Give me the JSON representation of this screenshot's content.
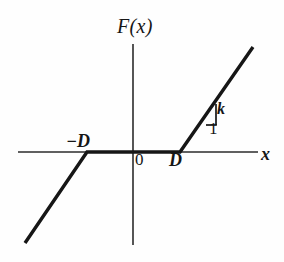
{
  "figure": {
    "title_visible": false,
    "background_color": "#fefefe",
    "ink_color": "#161616",
    "width_px": 284,
    "height_px": 262
  },
  "labels": {
    "y_axis": "F(x)",
    "x_axis": "x",
    "origin": "0",
    "breakpoint_positive": "D",
    "breakpoint_negative": "−D",
    "slope_rise": "k",
    "slope_run": "1"
  },
  "chart_data": {
    "type": "line",
    "title": "",
    "xlabel": "x",
    "ylabel": "F(x)",
    "grid": false,
    "legend": null,
    "axes": {
      "x_axis_y_px": 152,
      "y_axis_x_px": 133,
      "x_axis_start_px": 18,
      "x_axis_end_px": 258,
      "y_axis_top_px": 44,
      "y_axis_bottom_px": 245,
      "x_arrow": false,
      "y_arrow": false
    },
    "parameters": {
      "D": "D",
      "slope": "k"
    },
    "series": [
      {
        "name": "F(x)",
        "kind": "piecewise-linear",
        "points_px": [
          {
            "x": 25,
            "y": 243
          },
          {
            "x": 87,
            "y": 152
          },
          {
            "x": 180,
            "y": 152
          },
          {
            "x": 253,
            "y": 47
          }
        ],
        "segments": [
          {
            "name": "lower-left-ramp",
            "from_px": {
              "x": 25,
              "y": 243
            },
            "to_px": {
              "x": 87,
              "y": 152
            },
            "slope_label": "k"
          },
          {
            "name": "deadband-flat",
            "from_px": {
              "x": 87,
              "y": 152
            },
            "to_px": {
              "x": 180,
              "y": 152
            },
            "slope_label": "0"
          },
          {
            "name": "upper-right-ramp",
            "from_px": {
              "x": 180,
              "y": 152
            },
            "to_px": {
              "x": 253,
              "y": 47
            },
            "slope_label": "k"
          }
        ]
      }
    ],
    "annotations": [
      {
        "name": "slope-triangle",
        "rise_label": "k",
        "run_label": "1",
        "vertex_on_line_px": {
          "x": 206,
          "y": 104
        },
        "corner_px": {
          "x": 216,
          "y": 125
        },
        "base_left_px": {
          "x": 206,
          "y": 125
        }
      },
      {
        "name": "tick-negative-D",
        "label": "−D",
        "at_px": {
          "x": 87,
          "y": 152
        }
      },
      {
        "name": "tick-positive-D",
        "label": "D",
        "at_px": {
          "x": 180,
          "y": 152
        }
      },
      {
        "name": "origin",
        "label": "0",
        "at_px": {
          "x": 133,
          "y": 152
        }
      }
    ]
  }
}
